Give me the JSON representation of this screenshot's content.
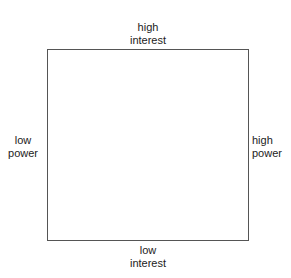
{
  "diagram": {
    "type": "power-interest grid",
    "labels": {
      "top": [
        "high",
        "interest"
      ],
      "bottom": [
        "low",
        "interest"
      ],
      "left": [
        "low",
        "power"
      ],
      "right": [
        "high",
        "power"
      ]
    }
  }
}
